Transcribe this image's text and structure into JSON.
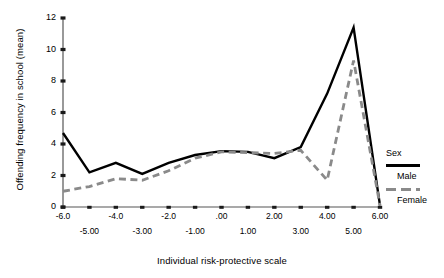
{
  "chart_data": {
    "type": "line",
    "title": "",
    "xlabel": "Individual risk-protective scale",
    "ylabel": "Offending frequency in school (mean)",
    "xlim": [
      -6,
      6
    ],
    "ylim": [
      0,
      12
    ],
    "grid": false,
    "legend_position": "right",
    "legend_title": "Sex",
    "x": [
      -6,
      -5,
      -4,
      -3,
      -2,
      -1,
      0,
      1,
      2,
      3,
      4,
      5,
      6
    ],
    "xtick_labels": [
      "-6.0",
      "-5.00",
      "-4.0",
      "-3.00",
      "-2.0",
      "-1.00",
      ".00",
      "1.00",
      "2.00",
      "3.00",
      "4.00",
      "5.00",
      "6.00"
    ],
    "ytick_labels": [
      "0",
      "2",
      "4",
      "6",
      "8",
      "10",
      "12"
    ],
    "ytick_values": [
      0,
      2,
      4,
      6,
      8,
      10,
      12
    ],
    "series": [
      {
        "name": "Male",
        "style": "solid",
        "color": "#000000",
        "values": [
          4.7,
          2.2,
          2.8,
          2.1,
          2.8,
          3.3,
          3.55,
          3.5,
          3.1,
          3.8,
          7.2,
          11.4,
          0.1
        ]
      },
      {
        "name": "Female",
        "style": "dashed",
        "color": "#8a8a8a",
        "values": [
          1.0,
          1.3,
          1.8,
          1.7,
          2.3,
          3.1,
          3.5,
          3.45,
          3.4,
          3.6,
          1.7,
          9.3,
          0.1
        ]
      }
    ]
  },
  "legend": {
    "title": "Sex",
    "entries": [
      {
        "label": "Male",
        "style": "solid"
      },
      {
        "label": "Female",
        "style": "dashed"
      }
    ]
  }
}
